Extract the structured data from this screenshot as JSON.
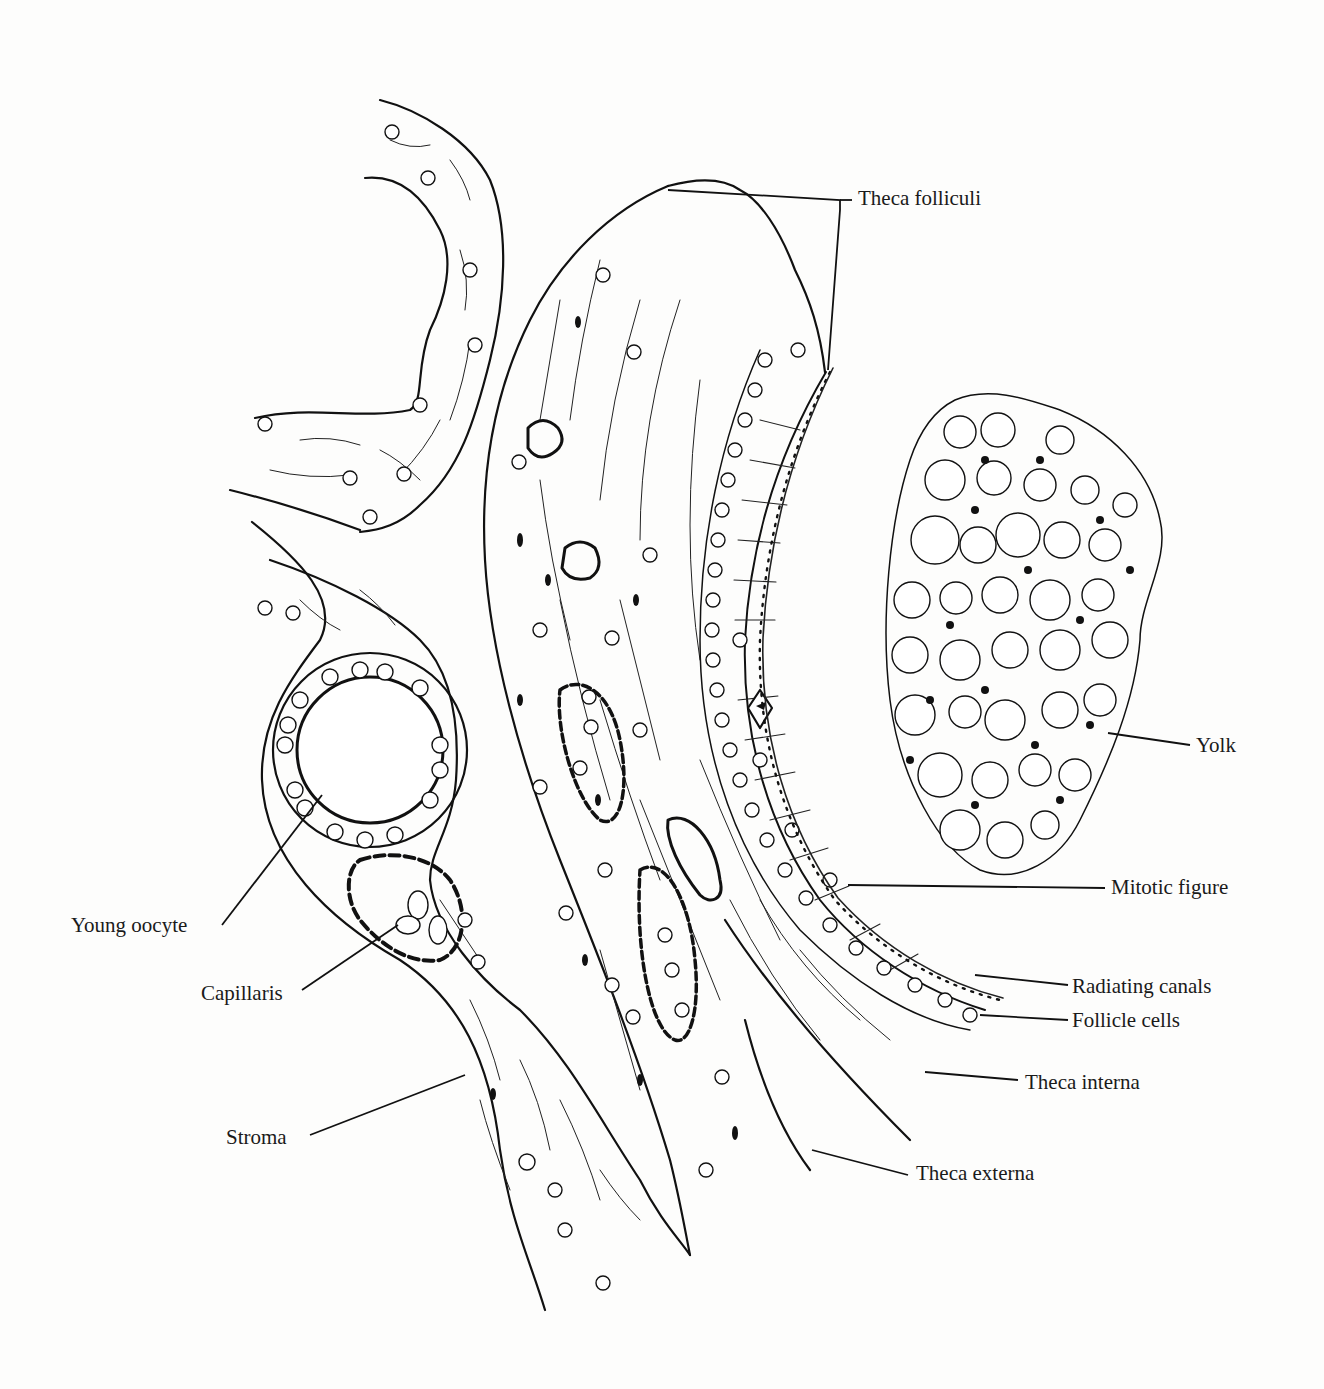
{
  "figure": {
    "labels": [
      {
        "id": "theca-folliculi",
        "text": "Theca folliculi"
      },
      {
        "id": "yolk",
        "text": "Yolk"
      },
      {
        "id": "mitotic-figure",
        "text": "Mitotic figure"
      },
      {
        "id": "young-oocyte",
        "text": "Young oocyte"
      },
      {
        "id": "capillaris",
        "text": "Capillaris"
      },
      {
        "id": "radiating-canals",
        "text": "Radiating canals"
      },
      {
        "id": "follicle-cells",
        "text": "Follicle cells"
      },
      {
        "id": "theca-interna",
        "text": "Theca interna"
      },
      {
        "id": "stroma",
        "text": "Stroma"
      },
      {
        "id": "theca-externa",
        "text": "Theca externa"
      }
    ]
  }
}
